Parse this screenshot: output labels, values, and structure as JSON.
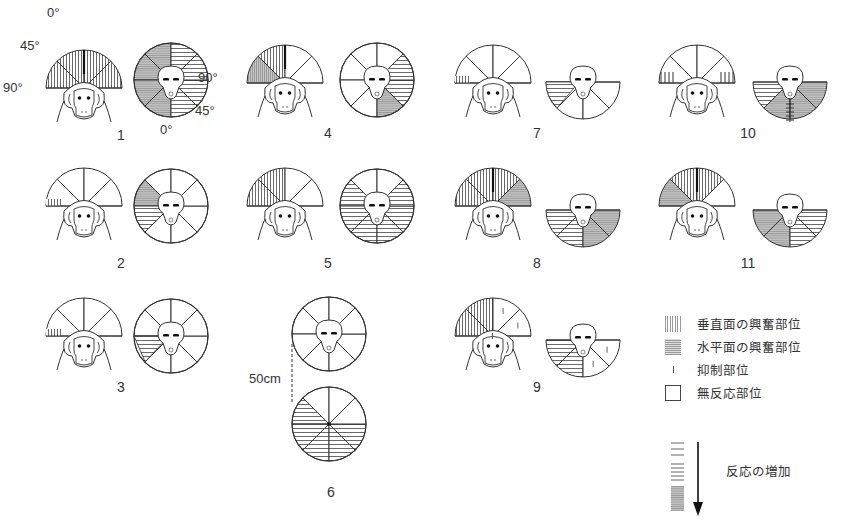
{
  "figure": {
    "angle_labels": {
      "zero": "0°",
      "forty_five": "45°",
      "ninety": "90°"
    },
    "distance_label": "50cm",
    "panels": [
      {
        "id": "1",
        "label": "1",
        "front": {
          "s0": "v",
          "s1": "v",
          "s2": "v",
          "s3": "v",
          "bold": true
        },
        "top": {
          "shape": "circle",
          "s0": "hg",
          "s1": "hg",
          "s2": "hg",
          "s3": "hg",
          "s4": "h",
          "s5": "h",
          "s6": "h",
          "s7": "h"
        }
      },
      {
        "id": "2",
        "label": "2",
        "front": {
          "s0": "vstrip"
        },
        "top": {
          "shape": "circle",
          "s1": "hg",
          "s2": "h"
        }
      },
      {
        "id": "3",
        "label": "3",
        "front": {
          "s0": "vstrip"
        },
        "top": {
          "shape": "circle",
          "s4": "htri"
        }
      },
      {
        "id": "4",
        "label": "4",
        "front": {
          "s0": "vg",
          "s1": "v",
          "bold": true
        },
        "top": {
          "shape": "circle",
          "s4": "hg",
          "s5": "h",
          "s6": "h"
        }
      },
      {
        "id": "5",
        "label": "5",
        "front": {
          "s0": "v",
          "s1": "v"
        },
        "top": {
          "shape": "circle",
          "s1": "h",
          "s2": "h",
          "s3": "h",
          "s4": "h",
          "s5": "h",
          "s6": "h"
        }
      },
      {
        "id": "6",
        "label": "6",
        "top_circle": {},
        "bottom_circle": {
          "s1": "h",
          "s2": "h",
          "s3": "h",
          "s4": "h",
          "s5": "h"
        }
      },
      {
        "id": "7",
        "label": "7",
        "front": {
          "s0": "vstrip"
        },
        "top": {
          "shape": "semi",
          "s0": "htri"
        }
      },
      {
        "id": "8",
        "label": "8",
        "front": {
          "s0": "v",
          "s1": "v",
          "s2": "v",
          "s3": "hg",
          "bold": true
        },
        "top": {
          "shape": "semi",
          "s0": "h",
          "s1": "h",
          "s2": "hg",
          "s3": "hg"
        }
      },
      {
        "id": "9",
        "label": "9",
        "front": {
          "s0": "v",
          "s1": "v",
          "s2": "i",
          "s3": "i"
        },
        "top": {
          "shape": "semi",
          "s0": "h",
          "s1": "h",
          "s2": "i",
          "s3": "i"
        }
      },
      {
        "id": "10",
        "label": "10",
        "front": {
          "s0": "vtick",
          "s3": "vtick"
        },
        "top": {
          "shape": "semi",
          "s0": "h",
          "s1": "hg",
          "s2": "hg",
          "s3": "hg",
          "spine": true
        }
      },
      {
        "id": "11",
        "label": "11",
        "front": {
          "s0": "hg",
          "s1": "v",
          "s2": "v",
          "bold": true
        },
        "top": {
          "shape": "semi",
          "s0": "hg",
          "s1": "hg",
          "s2": "h",
          "s3": "h"
        }
      }
    ]
  },
  "legend": {
    "items": [
      {
        "key": "vertical",
        "label": "垂直面の興奮部位"
      },
      {
        "key": "horizontal",
        "label": "水平面の興奮部位"
      },
      {
        "key": "inhibition",
        "label": "抑制部位"
      },
      {
        "key": "none",
        "label": "無反応部位"
      }
    ],
    "increase_label": "反応の増加"
  },
  "colors": {
    "line": "#333333",
    "gray_fill": "#bdbdbd",
    "text": "#333333"
  }
}
